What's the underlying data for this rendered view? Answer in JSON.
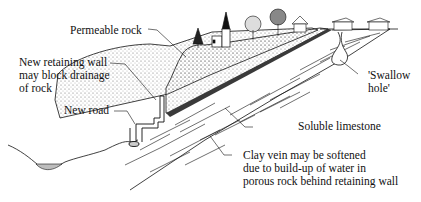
{
  "diagram": {
    "type": "geological cross-section",
    "labels": {
      "permeable_rock": "Permeable rock",
      "retaining_wall": [
        "New retaining wall",
        "may block drainage",
        "of rock"
      ],
      "new_road": "New road",
      "swallow_hole": [
        "'Swallow",
        "hole'"
      ],
      "soluble_limestone": "Soluble limestone",
      "clay_vein": [
        "Clay vein may be softened",
        "due to build-up of water in",
        "porous rock behind retaining wall"
      ]
    },
    "colors": {
      "line": "#111111",
      "clay_vein": "#3a3a3a",
      "water": "#bdbdbd",
      "stipple": "#555555"
    }
  }
}
